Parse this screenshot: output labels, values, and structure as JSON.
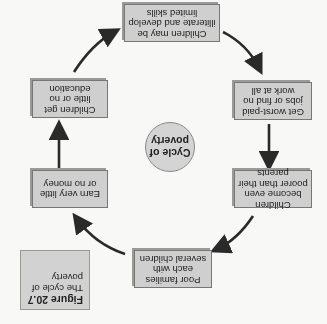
{
  "orientation": "rotated 180 degrees",
  "center": {
    "label_line1": "Cycle of",
    "label_line2": "poverty"
  },
  "steps": [
    {
      "text": "Children may be illiterate and develop limited skills"
    },
    {
      "text": "Get worst-paid jobs or find no work at all"
    },
    {
      "text": "Children become even poorer than their parents"
    },
    {
      "text": "Poor families each with several children"
    },
    {
      "text": "Earn very little or no money"
    },
    {
      "text": "Children get little or no education"
    }
  ],
  "figure": {
    "number": "Figure 20.7",
    "caption": "The cycle of poverty"
  },
  "colors": {
    "box_fill": "#cfcfcf",
    "arrow": "#2a2a2a",
    "background": "#f8f8f6"
  }
}
